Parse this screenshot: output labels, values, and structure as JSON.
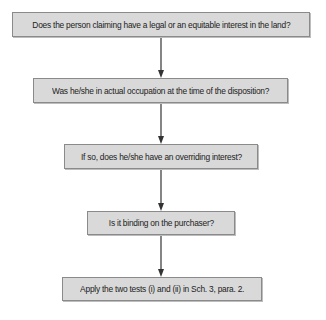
{
  "diagram": {
    "type": "flowchart",
    "direction": "top-to-bottom",
    "colors": {
      "box_fill": "#d9d9d9",
      "box_border": "#8a8a8a",
      "text": "#222222",
      "arrow": "#333333"
    },
    "steps": [
      {
        "label": "Does the person claiming have a legal or an equitable interest in the land?"
      },
      {
        "label": "Was he/she in actual occupation at the time of the disposition?"
      },
      {
        "label": "If so, does he/she have an overriding interest?"
      },
      {
        "label": "Is it binding on the purchaser?"
      },
      {
        "label": "Apply the two tests (i) and (ii) in Sch. 3, para. 2."
      }
    ],
    "connections": [
      {
        "from": 0,
        "to": 1
      },
      {
        "from": 1,
        "to": 2
      },
      {
        "from": 2,
        "to": 3
      },
      {
        "from": 3,
        "to": 4
      }
    ]
  }
}
